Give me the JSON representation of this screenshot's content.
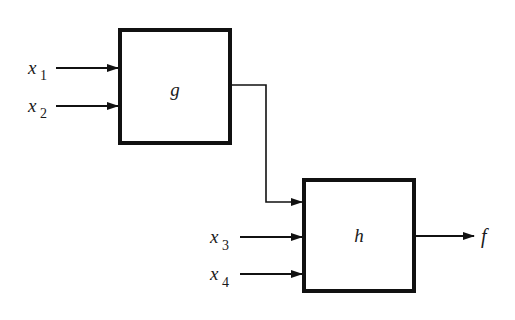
{
  "diagram": {
    "type": "block-diagram",
    "colors": {
      "stroke": "#111111",
      "background": "#ffffff"
    },
    "blocks": [
      {
        "id": "g",
        "label": "g",
        "x": 118,
        "y": 28,
        "w": 114,
        "h": 117
      },
      {
        "id": "h",
        "label": "h",
        "x": 302,
        "y": 178,
        "w": 114,
        "h": 115
      }
    ],
    "inputs": [
      {
        "id": "x1",
        "name": "x",
        "index": "1",
        "target": "g",
        "y": 68
      },
      {
        "id": "x2",
        "name": "x",
        "index": "2",
        "target": "g",
        "y": 106
      },
      {
        "id": "x3",
        "name": "x",
        "index": "3",
        "target": "h",
        "y": 237
      },
      {
        "id": "x4",
        "name": "x",
        "index": "4",
        "target": "h",
        "y": 274
      }
    ],
    "connections": [
      {
        "from": "g",
        "to": "h",
        "description": "output of g feeds first input of h"
      }
    ],
    "output": {
      "id": "f",
      "label": "f",
      "source": "h",
      "y": 236
    }
  }
}
